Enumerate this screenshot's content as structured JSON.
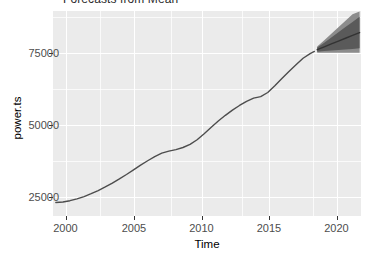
{
  "chart_data": {
    "type": "line",
    "title": "Forecasts from Mean",
    "xlabel": "Time",
    "ylabel": "power.ts",
    "xlim": [
      1999.5,
      2021.3
    ],
    "ylim": [
      8000,
      87000
    ],
    "xticks": [
      2000,
      2005,
      2010,
      2015,
      2020
    ],
    "xtick_labels": [
      "2000",
      "2005",
      "2010",
      "2015",
      "2020"
    ],
    "yticks": [
      25000,
      50000,
      75000
    ],
    "ytick_labels": [
      "25000",
      "50000",
      "75000"
    ],
    "grid": true,
    "legend": "none",
    "panel_background": "#ebebeb",
    "gridline_color": "#ffffff",
    "line_color": "#4d4d4d",
    "forecast_color": "#333333",
    "series": [
      {
        "name": "power.ts",
        "kind": "historical",
        "x": [
          1999.7,
          2000.2,
          2000.7,
          2001.2,
          2001.7,
          2002.2,
          2002.7,
          2003.2,
          2003.7,
          2004.2,
          2004.7,
          2005.2,
          2005.7,
          2006.2,
          2006.7,
          2007.2,
          2007.7,
          2008.2,
          2008.7,
          2009.2,
          2009.7,
          2010.2,
          2010.7,
          2011.2,
          2011.7,
          2012.2,
          2012.7,
          2013.2,
          2013.7,
          2014.2,
          2014.7,
          2015.2,
          2015.7,
          2016.2,
          2016.7,
          2017.2,
          2017.7,
          2018.0
        ],
        "y": [
          13200,
          13400,
          13900,
          14600,
          15500,
          16600,
          17800,
          19200,
          20700,
          22300,
          24000,
          25800,
          27600,
          29300,
          30900,
          32200,
          33000,
          33600,
          34400,
          35600,
          37400,
          39700,
          42200,
          44600,
          46800,
          48800,
          50600,
          52200,
          53400,
          54000,
          55600,
          58200,
          61000,
          63700,
          66300,
          68800,
          70600,
          71400
        ]
      },
      {
        "name": "point forecast",
        "kind": "forecast-mean",
        "x": [
          2018.2,
          2018.7,
          2019.2,
          2019.7,
          2020.2,
          2020.7,
          2021.2
        ],
        "y": [
          72100,
          73200,
          74300,
          75400,
          76500,
          77600,
          78700
        ]
      }
    ],
    "forecast_intervals": [
      {
        "level": 80,
        "shade": "#5a5a5a",
        "x": [
          2018.2,
          2018.7,
          2019.2,
          2019.7,
          2020.2,
          2020.7,
          2021.2
        ],
        "lower": [
          71300,
          71600,
          71800,
          72000,
          72200,
          72400,
          72600
        ],
        "upper": [
          72900,
          74800,
          76800,
          78800,
          80800,
          82800,
          84800
        ]
      },
      {
        "level": 95,
        "shade": "#8c8c8c",
        "x": [
          2018.2,
          2018.7,
          2019.2,
          2019.7,
          2020.2,
          2020.7,
          2021.2
        ],
        "lower": [
          70900,
          70900,
          70900,
          70900,
          70900,
          70900,
          70900
        ],
        "upper": [
          73300,
          75700,
          78200,
          80700,
          83200,
          85700,
          86800
        ]
      }
    ]
  }
}
